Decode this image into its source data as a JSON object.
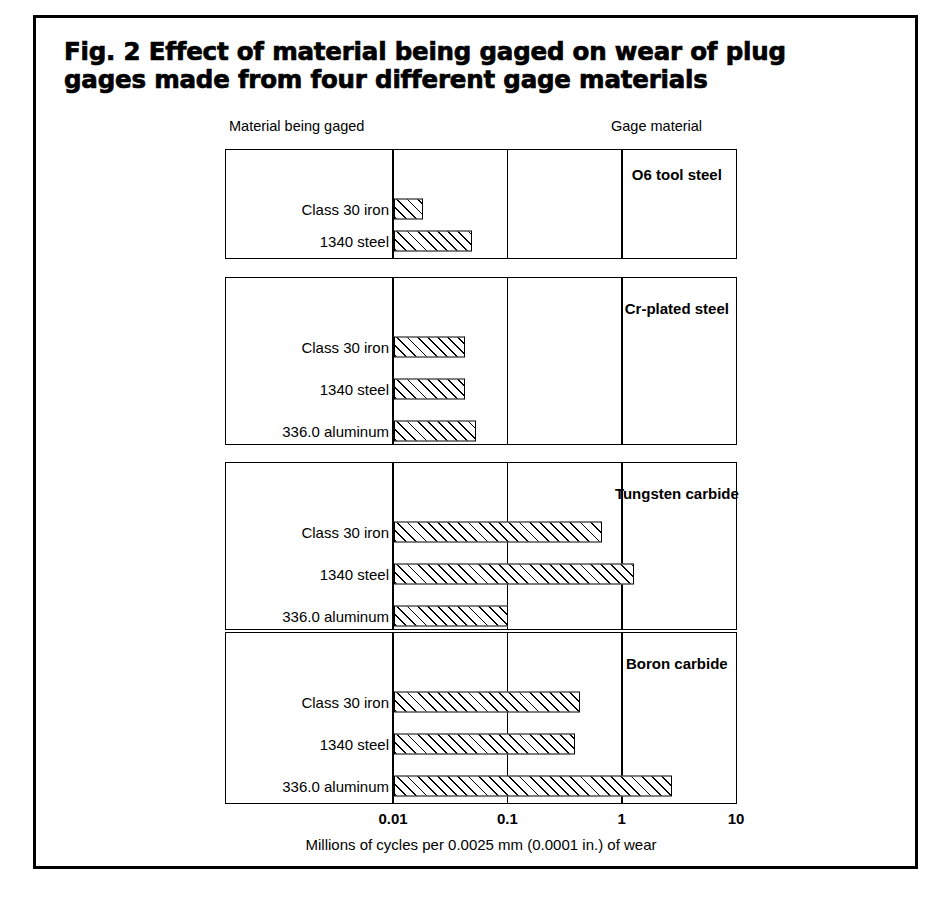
{
  "figure": {
    "title": "Fig. 2 Effect of material being gaged on wear of plug gages made from four different gage materials"
  },
  "headers": {
    "left": "Material being gaged",
    "right": "Gage material"
  },
  "axis": {
    "caption": "Millions of cycles per 0.0025 mm (0.0001 in.) of wear",
    "ticks": [
      "0.01",
      "0.1",
      "1",
      "10"
    ]
  },
  "chart_data": {
    "type": "bar",
    "orientation": "horizontal",
    "title": "Fig. 2 Effect of material being gaged on wear of plug gages made from four different gage materials",
    "xlabel": "Millions of cycles per 0.0025 mm (0.0001 in.) of wear",
    "ylabel": "Material being gaged",
    "xscale": "log",
    "xlim": [
      0.01,
      10
    ],
    "xticks": [
      0.01,
      0.1,
      1,
      10
    ],
    "xtick_labels": [
      "0.01",
      "0.1",
      "1",
      "10"
    ],
    "grid": true,
    "legend": "none",
    "group_label_header": "Gage material",
    "groups": [
      {
        "name": "O6 tool steel",
        "categories": [
          "Class 30 iron",
          "1340 steel"
        ],
        "values": [
          0.018,
          0.048
        ]
      },
      {
        "name": "Cr-plated steel",
        "categories": [
          "Class 30 iron",
          "1340 steel",
          "336.0 aluminum"
        ],
        "values": [
          0.042,
          0.042,
          0.052
        ]
      },
      {
        "name": "Tungsten carbide",
        "categories": [
          "Class 30 iron",
          "1340 steel",
          "336.0 aluminum"
        ],
        "values": [
          0.66,
          1.26,
          0.1
        ]
      },
      {
        "name": "Boron carbide",
        "categories": [
          "Class 30 iron",
          "1340 steel",
          "336.0 aluminum"
        ],
        "values": [
          0.42,
          0.38,
          2.7
        ]
      }
    ]
  }
}
